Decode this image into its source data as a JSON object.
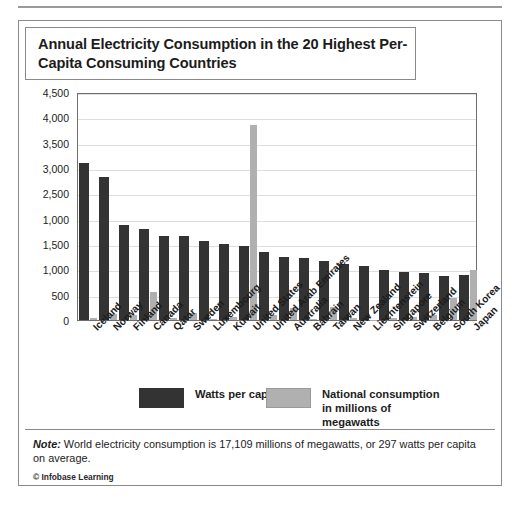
{
  "figure": {
    "title": "Annual Electricity Consumption in the 20 Highest Per-Capita Consuming Countries",
    "note_prefix": "Note:",
    "note_body": " World electricity consumption is 17,109 millions of megawatts, or 297 watts per capita on average.",
    "credit": "© Infobase Learning"
  },
  "legend": {
    "series_1_label": "Watts per capita",
    "series_2_label": "National consumption in millions of megawatts",
    "series_1_color": "#333333",
    "series_2_color": "#b0b0b0"
  },
  "chart_data": {
    "type": "bar",
    "title": "Annual Electricity Consumption in the 20 Highest Per-Capita Consuming Countries",
    "xlabel": "",
    "ylabel": "",
    "ylim": [
      0,
      4500
    ],
    "grid": true,
    "legend_position": "bottom",
    "ytick_labels": [
      "4,500",
      "4,000",
      "3,500",
      "3,000",
      "2,500",
      "1,000",
      "1,500",
      "1,000",
      "500",
      "0"
    ],
    "ytick_values": [
      4500,
      4000,
      3500,
      3000,
      2500,
      2000,
      1500,
      1000,
      500,
      0
    ],
    "categories": [
      "Iceland",
      "Norway",
      "Finland",
      "Canada",
      "Qatar",
      "Sweden",
      "Luxembourg",
      "Kuwait",
      "United States",
      "United Arab Emirates",
      "Australia",
      "Bahrain",
      "Taiwan",
      "New Zealand",
      "Liechtenstein",
      "Singapore",
      "Switzerland",
      "Belgium",
      "South Korea",
      "Japan"
    ],
    "series": [
      {
        "name": "Watts per capita",
        "color": "#333333",
        "values": [
          3100,
          2820,
          1880,
          1800,
          1660,
          1660,
          1560,
          1500,
          1470,
          1340,
          1240,
          1230,
          1160,
          1100,
          1070,
          990,
          940,
          930,
          870,
          880
        ]
      },
      {
        "name": "National consumption in millions of megawatts",
        "color": "#b0b0b0",
        "values": [
          40,
          125,
          100,
          550,
          30,
          140,
          20,
          50,
          3850,
          90,
          240,
          20,
          250,
          40,
          10,
          40,
          60,
          90,
          440,
          980
        ]
      }
    ]
  }
}
